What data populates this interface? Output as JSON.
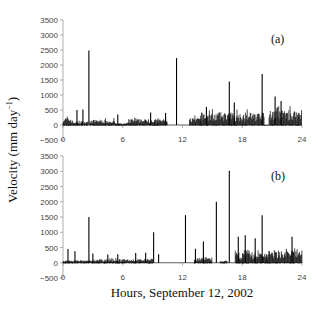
{
  "chart_data": [
    {
      "type": "bar",
      "panel_label": "(a)",
      "title": "",
      "xlabel": "Hours, September 12, 2002",
      "ylabel": "Velocity (mm day⁻¹)",
      "xlim": [
        0,
        24
      ],
      "ylim": [
        -500,
        3500
      ],
      "xticks": [
        0,
        6,
        12,
        18,
        24
      ],
      "yticks": [
        -500,
        0,
        500,
        1000,
        1500,
        2000,
        2500,
        3000,
        3500
      ],
      "grid": false,
      "spikes": [
        {
          "hour": 2.6,
          "value": 2480
        },
        {
          "hour": 11.4,
          "value": 2230
        },
        {
          "hour": 16.7,
          "value": 1450
        },
        {
          "hour": 20.0,
          "value": 1700
        },
        {
          "hour": 2.0,
          "value": 520
        },
        {
          "hour": 1.4,
          "value": 500
        },
        {
          "hour": 5.5,
          "value": 350
        },
        {
          "hour": 8.8,
          "value": 420
        },
        {
          "hour": 10.3,
          "value": 400
        },
        {
          "hour": 14.4,
          "value": 600
        },
        {
          "hour": 17.2,
          "value": 750
        },
        {
          "hour": 21.3,
          "value": 950
        },
        {
          "hour": 21.9,
          "value": 800
        }
      ],
      "noise_segments": [
        {
          "from": 0.0,
          "to": 0.9,
          "level": 250
        },
        {
          "from": 0.9,
          "to": 2.5,
          "level": 120
        },
        {
          "from": 2.7,
          "to": 5.2,
          "level": 180
        },
        {
          "from": 5.2,
          "to": 6.6,
          "level": 60
        },
        {
          "from": 6.6,
          "to": 10.5,
          "level": 200
        },
        {
          "from": 12.7,
          "to": 13.8,
          "level": 250
        },
        {
          "from": 13.8,
          "to": 20.2,
          "level": 420
        },
        {
          "from": 20.2,
          "to": 20.7,
          "level": 0
        },
        {
          "from": 20.7,
          "to": 24.0,
          "level": 500
        }
      ]
    },
    {
      "type": "bar",
      "panel_label": "(b)",
      "title": "",
      "xlabel": "Hours, September 12, 2002",
      "ylabel": "Velocity (mm day⁻¹)",
      "xlim": [
        0,
        24
      ],
      "ylim": [
        -500,
        3500
      ],
      "xticks": [
        0,
        6,
        12,
        18,
        24
      ],
      "yticks": [
        -500,
        0,
        500,
        1000,
        1500,
        2000,
        2500,
        3000,
        3500
      ],
      "grid": false,
      "spikes": [
        {
          "hour": 0.5,
          "value": 450
        },
        {
          "hour": 1.2,
          "value": 380
        },
        {
          "hour": 2.6,
          "value": 1500
        },
        {
          "hour": 3.0,
          "value": 300
        },
        {
          "hour": 4.5,
          "value": 270
        },
        {
          "hour": 5.5,
          "value": 280
        },
        {
          "hour": 7.3,
          "value": 320
        },
        {
          "hour": 8.3,
          "value": 330
        },
        {
          "hour": 9.1,
          "value": 1000
        },
        {
          "hour": 9.6,
          "value": 280
        },
        {
          "hour": 12.3,
          "value": 1560
        },
        {
          "hour": 13.3,
          "value": 460
        },
        {
          "hour": 14.1,
          "value": 700
        },
        {
          "hour": 15.4,
          "value": 2000
        },
        {
          "hour": 16.7,
          "value": 3020
        },
        {
          "hour": 17.6,
          "value": 850
        },
        {
          "hour": 18.3,
          "value": 900
        },
        {
          "hour": 19.3,
          "value": 800
        },
        {
          "hour": 20.0,
          "value": 1560
        },
        {
          "hour": 23.0,
          "value": 850
        }
      ],
      "noise_segments": [
        {
          "from": 0.0,
          "to": 3.5,
          "level": 80
        },
        {
          "from": 3.5,
          "to": 9.0,
          "level": 120
        },
        {
          "from": 13.2,
          "to": 15.0,
          "level": 180
        },
        {
          "from": 15.8,
          "to": 16.5,
          "level": 60
        },
        {
          "from": 17.3,
          "to": 20.5,
          "level": 350
        },
        {
          "from": 20.5,
          "to": 24.0,
          "level": 420
        }
      ]
    }
  ],
  "figure": {
    "ylabel": "Velocity (mm day",
    "ylabel_sup": "−1",
    "ylabel_close": ")",
    "xlabel": "Hours, September 12, 2002",
    "panels": [
      {
        "label": "(a)"
      },
      {
        "label": "(b)"
      }
    ]
  }
}
